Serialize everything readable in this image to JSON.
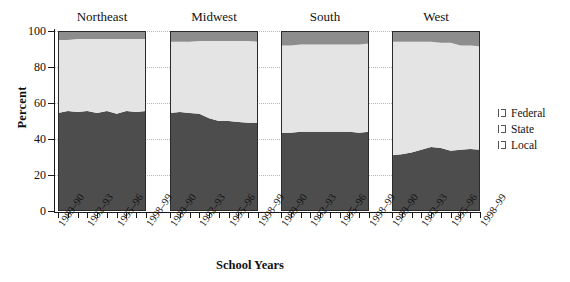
{
  "chart_data": {
    "type": "area",
    "title": "",
    "xlabel": "School Years",
    "ylabel": "Percent",
    "ylim": [
      0,
      100
    ],
    "yticks": [
      0,
      20,
      40,
      60,
      80,
      100
    ],
    "grid": true,
    "legend_position": "right",
    "stacked": true,
    "stack_order": [
      "Local",
      "State",
      "Federal"
    ],
    "x": [
      "1989–90",
      "1990–91",
      "1991–92",
      "1992–93",
      "1993–94",
      "1994–95",
      "1995–96",
      "1996–97",
      "1997–98",
      "1998–99"
    ],
    "tick_labels": [
      "1989–90",
      "1992–93",
      "1995–96",
      "1998–99"
    ],
    "panels": [
      {
        "name": "Northeast",
        "series": [
          {
            "name": "Local",
            "values": [
              54.5,
              55.5,
              55.0,
              55.5,
              54.5,
              55.5,
              54.0,
              55.5,
              55.0,
              55.5
            ]
          },
          {
            "name": "State",
            "values": [
              40.5,
              39.5,
              40.5,
              40.0,
              41.0,
              40.0,
              41.5,
              40.0,
              40.5,
              40.0
            ]
          },
          {
            "name": "Federal",
            "values": [
              5.0,
              5.0,
              4.5,
              4.5,
              4.5,
              4.5,
              4.5,
              4.5,
              4.5,
              4.5
            ]
          }
        ]
      },
      {
        "name": "Midwest",
        "series": [
          {
            "name": "Local",
            "values": [
              54.5,
              55.0,
              54.5,
              54.0,
              51.5,
              50.0,
              50.0,
              49.5,
              49.0,
              49.0
            ]
          },
          {
            "name": "State",
            "values": [
              39.5,
              39.0,
              39.5,
              40.5,
              43.0,
              44.5,
              44.5,
              45.0,
              45.5,
              45.0
            ]
          },
          {
            "name": "Federal",
            "values": [
              6.0,
              6.0,
              6.0,
              5.5,
              5.5,
              5.5,
              5.5,
              5.5,
              5.5,
              6.0
            ]
          }
        ]
      },
      {
        "name": "South",
        "series": [
          {
            "name": "Local",
            "values": [
              43.5,
              43.5,
              44.0,
              44.0,
              44.0,
              44.0,
              44.0,
              44.0,
              43.5,
              44.0
            ]
          },
          {
            "name": "State",
            "values": [
              48.5,
              48.5,
              48.5,
              48.5,
              48.5,
              48.5,
              48.5,
              48.5,
              49.0,
              49.0
            ]
          },
          {
            "name": "Federal",
            "values": [
              8.0,
              8.0,
              7.5,
              7.5,
              7.5,
              7.5,
              7.5,
              7.5,
              7.5,
              7.0
            ]
          }
        ]
      },
      {
        "name": "West",
        "series": [
          {
            "name": "Local",
            "values": [
              31.0,
              31.5,
              32.5,
              34.0,
              35.5,
              35.0,
              33.5,
              34.0,
              34.5,
              34.0
            ]
          },
          {
            "name": "State",
            "values": [
              63.0,
              62.5,
              61.5,
              60.0,
              58.5,
              58.5,
              60.0,
              58.0,
              57.5,
              57.5
            ]
          },
          {
            "name": "Federal",
            "values": [
              6.0,
              6.0,
              6.0,
              6.0,
              6.0,
              6.5,
              6.5,
              8.0,
              8.0,
              8.5
            ]
          }
        ]
      }
    ],
    "legend": [
      {
        "label": "Federal",
        "color": "#8d8d8d"
      },
      {
        "label": "State",
        "color": "#ffffff"
      },
      {
        "label": "Local",
        "color": "#4d4d4d"
      }
    ],
    "colors": {
      "federal": "#8d8d8d",
      "state": "#e4e4e4",
      "local": "#4d4d4d",
      "axis": "#1a1a1a",
      "grid": "#b9b9b9"
    }
  }
}
